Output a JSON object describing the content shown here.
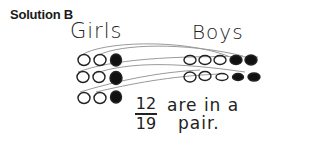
{
  "title": "Solution B",
  "girls": {
    "label": "Girls",
    "rows": [
      {
        "open": 2,
        "filled": 1
      },
      {
        "open": 2,
        "filled": 1
      },
      {
        "open": 2,
        "filled": 1
      }
    ]
  },
  "boys": {
    "label": "Boys",
    "rows": [
      {
        "open": 3,
        "filled": 2
      },
      {
        "open": 3,
        "filled": 2
      }
    ]
  },
  "answer": {
    "numerator": "12",
    "denominator": "19",
    "text_line1": "are in a",
    "text_line2": "pair."
  },
  "colors": {
    "ink": "#222222",
    "pencil_lines": "#9a9a9a"
  }
}
